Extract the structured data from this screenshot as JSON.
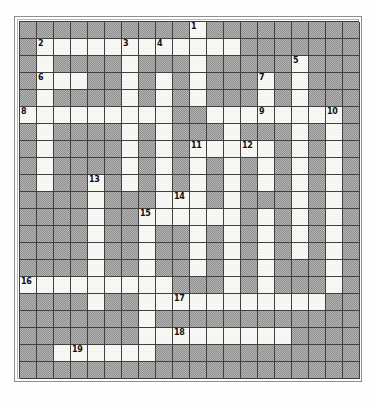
{
  "document": {
    "type": "crossword-puzzle-grid",
    "title": "Crossword Puzzle",
    "rendering": "scanned black and white printed crossword grid"
  },
  "grid": {
    "columns": 20,
    "rows": 21,
    "cell_size_px": 17,
    "open_cell_color": "#f7f7f4",
    "blocked_cell_color": "#a8a8a8",
    "line_color": "#404040",
    "legend": {
      "1": "open / writable letter square (white)",
      "0": "blocked square (shaded)"
    },
    "cells": [
      [
        0,
        0,
        0,
        0,
        0,
        0,
        0,
        0,
        0,
        0,
        1,
        0,
        0,
        0,
        0,
        0,
        0,
        0,
        0,
        0
      ],
      [
        0,
        1,
        1,
        1,
        1,
        1,
        1,
        1,
        1,
        1,
        1,
        1,
        1,
        0,
        0,
        0,
        0,
        0,
        0,
        0
      ],
      [
        0,
        1,
        0,
        0,
        0,
        0,
        1,
        0,
        0,
        0,
        1,
        0,
        0,
        0,
        0,
        0,
        1,
        0,
        0,
        0
      ],
      [
        0,
        1,
        1,
        1,
        0,
        0,
        1,
        0,
        1,
        0,
        1,
        0,
        0,
        0,
        1,
        0,
        1,
        0,
        0,
        0
      ],
      [
        0,
        1,
        0,
        0,
        0,
        0,
        1,
        0,
        1,
        0,
        1,
        0,
        0,
        0,
        1,
        0,
        1,
        0,
        0,
        0
      ],
      [
        1,
        1,
        1,
        1,
        1,
        1,
        1,
        1,
        1,
        0,
        0,
        1,
        1,
        1,
        1,
        1,
        1,
        1,
        1,
        0
      ],
      [
        0,
        1,
        0,
        0,
        0,
        0,
        1,
        0,
        1,
        0,
        0,
        0,
        1,
        0,
        0,
        0,
        1,
        0,
        1,
        0
      ],
      [
        0,
        1,
        0,
        0,
        0,
        0,
        1,
        0,
        1,
        0,
        1,
        1,
        1,
        1,
        1,
        0,
        1,
        0,
        1,
        0
      ],
      [
        0,
        1,
        0,
        0,
        0,
        0,
        1,
        0,
        1,
        0,
        1,
        0,
        1,
        0,
        1,
        0,
        1,
        0,
        1,
        0
      ],
      [
        0,
        1,
        0,
        0,
        1,
        0,
        1,
        0,
        1,
        0,
        1,
        0,
        1,
        0,
        1,
        0,
        1,
        0,
        1,
        0
      ],
      [
        0,
        0,
        0,
        0,
        1,
        0,
        0,
        0,
        1,
        1,
        1,
        0,
        1,
        0,
        0,
        0,
        1,
        0,
        1,
        0
      ],
      [
        0,
        0,
        0,
        0,
        1,
        0,
        0,
        1,
        1,
        1,
        1,
        1,
        1,
        0,
        1,
        0,
        1,
        0,
        1,
        0
      ],
      [
        0,
        0,
        0,
        0,
        1,
        0,
        0,
        1,
        0,
        0,
        1,
        0,
        1,
        0,
        1,
        0,
        1,
        0,
        1,
        0
      ],
      [
        0,
        0,
        0,
        0,
        1,
        0,
        0,
        1,
        0,
        0,
        1,
        0,
        1,
        0,
        1,
        0,
        1,
        0,
        1,
        0
      ],
      [
        0,
        0,
        0,
        0,
        1,
        0,
        0,
        1,
        0,
        0,
        1,
        0,
        1,
        0,
        1,
        0,
        0,
        0,
        1,
        0
      ],
      [
        1,
        1,
        1,
        1,
        1,
        1,
        1,
        1,
        1,
        0,
        0,
        0,
        1,
        0,
        1,
        0,
        0,
        0,
        1,
        0
      ],
      [
        0,
        0,
        0,
        0,
        1,
        0,
        0,
        1,
        1,
        1,
        1,
        1,
        1,
        1,
        1,
        1,
        1,
        1,
        0,
        0
      ],
      [
        0,
        0,
        0,
        0,
        0,
        0,
        0,
        1,
        0,
        0,
        0,
        0,
        0,
        0,
        0,
        0,
        0,
        0,
        0,
        0
      ],
      [
        0,
        0,
        0,
        0,
        0,
        0,
        0,
        1,
        1,
        1,
        1,
        1,
        1,
        1,
        1,
        1,
        0,
        0,
        0,
        0
      ],
      [
        0,
        0,
        1,
        1,
        1,
        1,
        1,
        1,
        0,
        0,
        0,
        0,
        0,
        0,
        0,
        0,
        0,
        0,
        0,
        0
      ],
      [
        0,
        0,
        0,
        0,
        0,
        0,
        0,
        0,
        0,
        0,
        0,
        0,
        0,
        0,
        0,
        0,
        0,
        0,
        0,
        0
      ]
    ],
    "numbers": [
      {
        "label": "1",
        "row": 0,
        "col": 10
      },
      {
        "label": "2",
        "row": 1,
        "col": 1
      },
      {
        "label": "3",
        "row": 1,
        "col": 6
      },
      {
        "label": "4",
        "row": 1,
        "col": 8
      },
      {
        "label": "5",
        "row": 2,
        "col": 16
      },
      {
        "label": "6",
        "row": 3,
        "col": 1
      },
      {
        "label": "7",
        "row": 3,
        "col": 14
      },
      {
        "label": "8",
        "row": 5,
        "col": 0
      },
      {
        "label": "9",
        "row": 5,
        "col": 14
      },
      {
        "label": "10",
        "row": 5,
        "col": 18
      },
      {
        "label": "11",
        "row": 7,
        "col": 10
      },
      {
        "label": "12",
        "row": 7,
        "col": 13
      },
      {
        "label": "13",
        "row": 9,
        "col": 4
      },
      {
        "label": "14",
        "row": 10,
        "col": 9
      },
      {
        "label": "15",
        "row": 11,
        "col": 7
      },
      {
        "label": "16",
        "row": 15,
        "col": 0
      },
      {
        "label": "17",
        "row": 16,
        "col": 9
      },
      {
        "label": "18",
        "row": 18,
        "col": 9
      },
      {
        "label": "19",
        "row": 19,
        "col": 3
      }
    ]
  }
}
